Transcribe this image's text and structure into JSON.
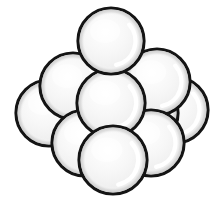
{
  "figure": {
    "background_color": "#ffffff",
    "canvas": {
      "width": 216,
      "height": 200
    },
    "sphere_count": 10,
    "rows": [
      1,
      2,
      3,
      4
    ],
    "style": {
      "outline_color": "#141414",
      "outline_width": 3.2,
      "fill_light": "#ffffff",
      "fill_mid": "#f2f2f2",
      "fill_shadow": "#dcdcdc",
      "highlight_color": "#ffffff",
      "sphere_radius": 33
    },
    "spheres": [
      {
        "id": "sphere-row4-left",
        "label": "bottom row far left",
        "cx": 49,
        "cy": 113,
        "r": 33,
        "z": 1
      },
      {
        "id": "sphere-row4-midleft",
        "label": "bottom row mid left",
        "cx": 97,
        "cy": 113,
        "r": 33,
        "z": 2
      },
      {
        "id": "sphere-row4-midright",
        "label": "bottom row mid right",
        "cx": 145,
        "cy": 113,
        "r": 33,
        "z": 3
      },
      {
        "id": "sphere-row4-right",
        "label": "bottom row far right",
        "cx": 175,
        "cy": 110,
        "r": 33,
        "z": 1
      },
      {
        "id": "sphere-row3-left",
        "label": "third row left",
        "cx": 73,
        "cy": 86,
        "r": 33,
        "z": 4
      },
      {
        "id": "sphere-row3-center",
        "label": "third row center",
        "cx": 111,
        "cy": 103,
        "r": 34,
        "z": 8
      },
      {
        "id": "sphere-row3-right",
        "label": "third row right",
        "cx": 157,
        "cy": 82,
        "r": 33,
        "z": 5
      },
      {
        "id": "sphere-row2-left",
        "label": "second row left",
        "cx": 85,
        "cy": 143,
        "r": 33,
        "z": 6
      },
      {
        "id": "sphere-row2-right",
        "label": "second row right",
        "cx": 151,
        "cy": 143,
        "r": 33,
        "z": 7
      },
      {
        "id": "sphere-row1-top",
        "label": "top sphere",
        "cx": 111,
        "cy": 41,
        "r": 33,
        "z": 9
      },
      {
        "id": "sphere-front-bottom",
        "label": "front bottom sphere",
        "cx": 113,
        "cy": 160,
        "r": 34,
        "z": 10
      }
    ]
  }
}
